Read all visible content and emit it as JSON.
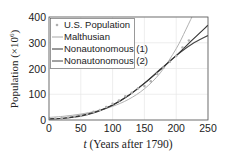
{
  "chart_data": {
    "type": "line",
    "title": "",
    "xlabel": "t (Years after 1790)",
    "xlabel_italic_part": "t",
    "xlabel_rest": " (Years after 1790)",
    "ylabel": "Population (×10^6)",
    "ylabel_text": "Population (×10",
    "ylabel_exp": "6",
    "xlim": [
      0,
      250
    ],
    "ylim": [
      0,
      400
    ],
    "xticks": [
      0,
      50,
      100,
      150,
      200,
      250
    ],
    "yticks": [
      0,
      100,
      200,
      300,
      400
    ],
    "grid": true,
    "legend_position": "upper left",
    "series": [
      {
        "name": "U.S. Population",
        "style": "markers",
        "color": "#b0b0b0",
        "x": [
          0,
          10,
          20,
          30,
          40,
          50,
          60,
          70,
          80,
          90,
          100,
          110,
          120,
          130,
          140,
          150,
          160,
          170,
          180,
          190,
          200,
          210,
          220
        ],
        "values": [
          3.9,
          5.3,
          7.2,
          9.6,
          12.9,
          17.1,
          23.2,
          31.4,
          38.6,
          50.2,
          62.9,
          76.0,
          92.0,
          105.7,
          122.8,
          131.7,
          150.7,
          179.3,
          203.3,
          226.5,
          248.7,
          281.4,
          308.7
        ]
      },
      {
        "name": "Malthusian",
        "style": "line",
        "color": "#a8a8a8",
        "x": [
          0,
          25,
          50,
          75,
          100,
          125,
          150,
          175,
          200,
          215,
          230,
          240
        ],
        "values": [
          10,
          15,
          23,
          35,
          53,
          80,
          121,
          183,
          277,
          350,
          430,
          500
        ]
      },
      {
        "name": "Nonautonomous (1)",
        "style": "line",
        "color": "#333333",
        "x": [
          0,
          25,
          50,
          75,
          100,
          125,
          150,
          175,
          200,
          225,
          250
        ],
        "values": [
          4,
          8,
          17,
          33,
          58,
          95,
          142,
          195,
          250,
          310,
          368
        ]
      },
      {
        "name": "Nonautonomous (2)",
        "style": "line",
        "color": "#444444",
        "x": [
          0,
          25,
          50,
          75,
          100,
          125,
          150,
          175,
          200,
          225,
          250
        ],
        "values": [
          4,
          7,
          15,
          31,
          57,
          95,
          143,
          197,
          250,
          295,
          328
        ]
      }
    ]
  },
  "legend": {
    "items": [
      {
        "label": "U.S. Population"
      },
      {
        "label": "Malthusian"
      },
      {
        "label": "Nonautonomous (1)"
      },
      {
        "label": "Nonautonomous (2)"
      }
    ]
  },
  "axes": {
    "xticks": [
      "0",
      "50",
      "100",
      "150",
      "200",
      "250"
    ],
    "yticks": [
      "0",
      "100",
      "200",
      "300",
      "400"
    ]
  }
}
